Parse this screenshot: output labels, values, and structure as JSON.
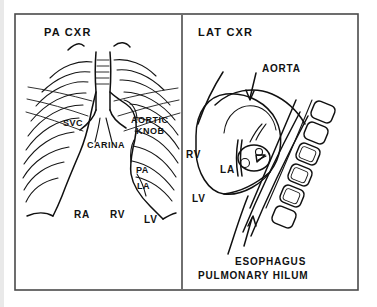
{
  "figure": {
    "panels": [
      {
        "id": "pa",
        "heading": "PA  CXR",
        "labels": [
          {
            "name": "svc",
            "text": "SVC"
          },
          {
            "name": "carina",
            "text": "CARINA"
          },
          {
            "name": "aortic-knob-line1",
            "text": "AORTIC"
          },
          {
            "name": "aortic-knob-line2",
            "text": "KNOB"
          },
          {
            "name": "pa",
            "text": "PA"
          },
          {
            "name": "la",
            "text": "LA"
          },
          {
            "name": "ra",
            "text": "RA"
          },
          {
            "name": "rv",
            "text": "RV"
          },
          {
            "name": "lv",
            "text": "LV"
          }
        ]
      },
      {
        "id": "lat",
        "heading": "LAT  CXR",
        "labels": [
          {
            "name": "aorta",
            "text": "AORTA"
          },
          {
            "name": "rv",
            "text": "RV"
          },
          {
            "name": "la",
            "text": "LA"
          },
          {
            "name": "lv",
            "text": "LV"
          },
          {
            "name": "esophagus",
            "text": "ESOPHAGUS"
          },
          {
            "name": "pulmonary-hilum",
            "text": "PULMONARY  HILUM"
          }
        ]
      }
    ]
  },
  "colors": {
    "ink": "#101010",
    "frame": "#4a4a4a",
    "divider": "#333333",
    "background": "#ffffff",
    "edge_strip": "#e9e9e9"
  }
}
